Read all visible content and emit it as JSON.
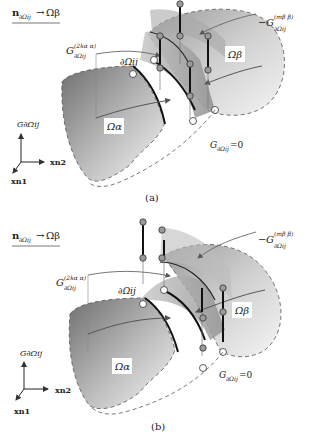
{
  "figure": {
    "panels": [
      {
        "id": "a",
        "caption": "(a)",
        "normal_label": {
          "base": "n",
          "sub": "∂Ωij",
          "arrow": "→",
          "target": "Ωβ"
        },
        "g_alpha_label": {
          "base": "G",
          "sup": "(2kα α)",
          "sub": "∂Ωij"
        },
        "g_beta_label": {
          "prefix": "−",
          "base": "G",
          "sup": "(mβ β)",
          "sub": "∂Ωij"
        },
        "boundary_label": "∂Ωij",
        "omega_alpha": "Ωα",
        "omega_beta": "Ωβ",
        "zero_label": {
          "base": "G",
          "sub": "∂Ωij",
          "suffix": "=0"
        },
        "axes": {
          "vertical": "G∂Ωij",
          "right": "xn2",
          "down": "xn1"
        }
      },
      {
        "id": "b",
        "caption": "(b)",
        "normal_label": {
          "base": "n",
          "sub": "∂Ωij",
          "arrow": "→",
          "target": "Ωβ"
        },
        "g_alpha_label": {
          "base": "G",
          "sup": "(2kα α)",
          "sub": "∂Ωij"
        },
        "g_beta_label": {
          "prefix": "−",
          "base": "G",
          "sup": "(mβ β)",
          "sub": "∂Ωij"
        },
        "boundary_label": "∂Ωij",
        "omega_alpha": "Ωα",
        "omega_beta": "Ωβ",
        "zero_label": {
          "base": "G",
          "sub": "∂Ωij",
          "suffix": "=0"
        },
        "axes": {
          "vertical": "G∂Ωij",
          "right": "xn2",
          "down": "xn1"
        }
      }
    ],
    "colors": {
      "surface_dark": "#7d7d7d",
      "surface_light": "#f2f2f2",
      "node_fill": "#9a9a9a",
      "open_node": "#ffffff",
      "line": "#111111",
      "curve": "#5a5a5a"
    }
  }
}
